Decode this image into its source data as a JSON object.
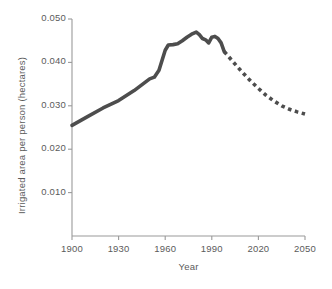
{
  "chart_data": {
    "type": "line",
    "title": "",
    "xlabel": "Year",
    "ylabel": "Irrigated area per person (hectares)",
    "xlim": [
      1900,
      2050
    ],
    "ylim": [
      0,
      0.05
    ],
    "xticks": [
      1900,
      1930,
      1960,
      1990,
      2020,
      2050
    ],
    "xtick_labels": [
      "1900",
      "1930",
      "1960",
      "1990",
      "2020",
      "2050"
    ],
    "yticks": [
      0.01,
      0.02,
      0.03,
      0.04,
      0.05
    ],
    "ytick_labels": [
      "0.010",
      "0.020",
      "0.030",
      "0.040",
      "0.050"
    ],
    "grid": false,
    "legend": "none",
    "line_color": "#4d4d4d",
    "axis_color": "#9a9a9a",
    "series": [
      {
        "name": "Historical irrigated area per person",
        "style": "solid",
        "x": [
          1900,
          1910,
          1920,
          1930,
          1940,
          1950,
          1953,
          1956,
          1958,
          1960,
          1962,
          1965,
          1968,
          1971,
          1974,
          1977,
          1980,
          1982,
          1984,
          1986,
          1988,
          1990,
          1992,
          1994,
          1996,
          1998
        ],
        "values": [
          0.0255,
          0.0275,
          0.0295,
          0.0312,
          0.0335,
          0.0362,
          0.0366,
          0.0382,
          0.0405,
          0.0428,
          0.044,
          0.0441,
          0.0443,
          0.045,
          0.0458,
          0.0465,
          0.047,
          0.0464,
          0.0455,
          0.0452,
          0.0445,
          0.0458,
          0.046,
          0.0455,
          0.0445,
          0.0425
        ]
      },
      {
        "name": "Projected irrigated area per person",
        "style": "dotted",
        "x": [
          1998,
          2005,
          2010,
          2015,
          2020,
          2025,
          2030,
          2035,
          2040,
          2045,
          2050
        ],
        "values": [
          0.0425,
          0.0396,
          0.0376,
          0.0357,
          0.034,
          0.0324,
          0.0311,
          0.03,
          0.0292,
          0.0286,
          0.0281
        ]
      }
    ]
  },
  "axis_titles": {
    "x": "Year",
    "y": "Irrigated area per person (hectares)"
  }
}
